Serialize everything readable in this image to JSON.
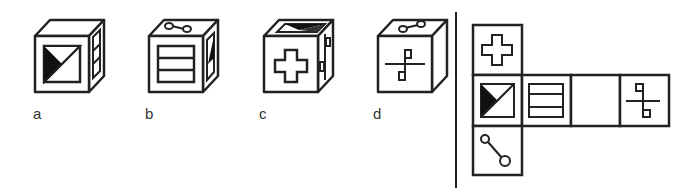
{
  "puzzle": {
    "type": "cube-net-folding",
    "options": [
      {
        "label": "a",
        "front": "half-shaded-square",
        "right": "three-stripes",
        "top": "blank"
      },
      {
        "label": "b",
        "front": "three-stripes",
        "right": "half-shaded-square",
        "top": "connected-circles"
      },
      {
        "label": "c",
        "front": "cross",
        "right": "hook-symbol",
        "top": "half-shaded-square"
      },
      {
        "label": "d",
        "front": "hook-symbol",
        "right": "blank",
        "top": "connected-circles"
      }
    ],
    "net": {
      "cells": [
        {
          "row": 0,
          "col": 0,
          "symbol": "cross"
        },
        {
          "row": 1,
          "col": 0,
          "symbol": "half-shaded-square"
        },
        {
          "row": 1,
          "col": 1,
          "symbol": "three-stripes"
        },
        {
          "row": 1,
          "col": 2,
          "symbol": "blank"
        },
        {
          "row": 1,
          "col": 3,
          "symbol": "hook-symbol"
        },
        {
          "row": 2,
          "col": 0,
          "symbol": "connected-circles"
        }
      ]
    }
  },
  "labels": {
    "a": "a",
    "b": "b",
    "c": "c",
    "d": "d"
  },
  "colors": {
    "stroke": "#222222",
    "fill": "#ffffff"
  }
}
